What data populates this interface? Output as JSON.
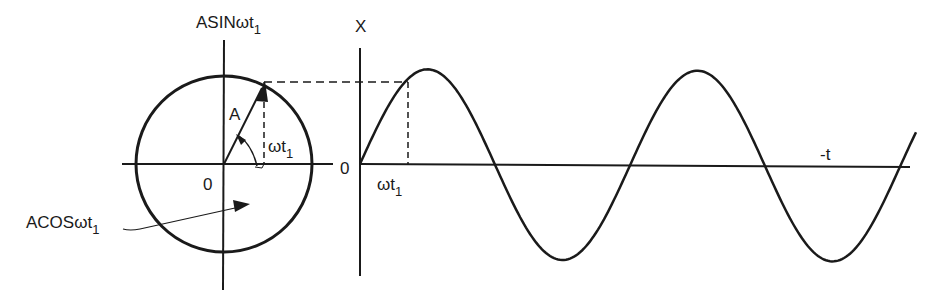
{
  "diagram": {
    "colors": {
      "ink": "#1a1a1a",
      "background": "#ffffff"
    },
    "phasor_circle": {
      "center": [
        224,
        164
      ],
      "radius": 88,
      "vertical_axis_label": {
        "main": "ASINωt",
        "sub": "1"
      },
      "horizontal_projection_label": {
        "main": "ACOSωt",
        "sub": "1"
      },
      "origin_label": "0",
      "vector_label": "A",
      "angle_label": {
        "main": "ωt",
        "sub": "1"
      }
    },
    "waveform": {
      "origin": [
        360,
        164
      ],
      "y_axis_label": "X",
      "x_axis_label": "-t",
      "origin_label": "0",
      "marker_label": {
        "main": "ωt",
        "sub": "1"
      },
      "amplitude_px": 95,
      "period_px": 270,
      "x_end": 916
    }
  },
  "chart_data": {
    "type": "line",
    "title": "",
    "xlabel": "-t",
    "ylabel": "X",
    "series": [
      {
        "name": "X = A sin(ωt)",
        "x_cycles": [
          0,
          0.25,
          0.5,
          0.75,
          1.0,
          1.25,
          1.5,
          1.75,
          2.0
        ],
        "values": [
          0,
          1,
          0,
          -1,
          0,
          1,
          0,
          -1,
          0
        ]
      }
    ],
    "annotations": [
      "ωt1",
      "ASINωt1",
      "ACOSωt1",
      "A",
      "0"
    ]
  }
}
